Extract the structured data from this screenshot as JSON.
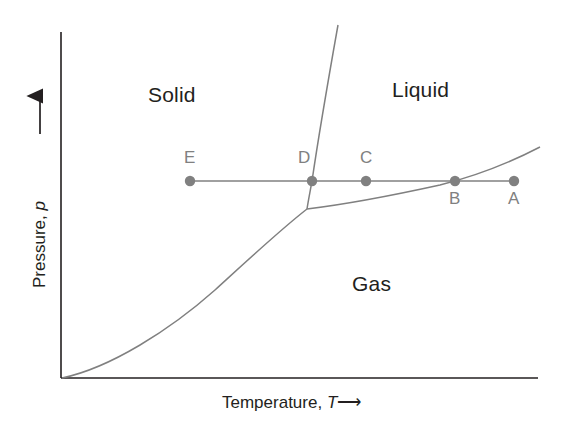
{
  "figure": {
    "kind": "phase-diagram",
    "background_color": "#ffffff",
    "axis_color": "#231f20",
    "curve_color": "#808080",
    "point_color": "#808080",
    "label_color": "#231f20"
  },
  "axes": {
    "y": {
      "title_text": "Pressure, ",
      "title_symbol": "p",
      "title_arrow": "⟶",
      "orientation": "vertical",
      "arrowhead": "up"
    },
    "x": {
      "title_text": "Temperature, ",
      "title_symbol": "T",
      "title_arrow": "⟶",
      "orientation": "horizontal",
      "arrowhead": "none"
    }
  },
  "regions": [
    {
      "id": "solid",
      "label": "Solid",
      "x": 148,
      "y": 83
    },
    {
      "id": "liquid",
      "label": "Liquid",
      "x": 392,
      "y": 78
    },
    {
      "id": "gas",
      "label": "Gas",
      "x": 352,
      "y": 272
    }
  ],
  "points": [
    {
      "id": "A",
      "label": "A",
      "cx": 514,
      "cy": 181,
      "label_x": 508,
      "label_y": 189,
      "on_curve": "none"
    },
    {
      "id": "B",
      "label": "B",
      "cx": 455,
      "cy": 181,
      "label_x": 449,
      "label_y": 189,
      "on_curve": "vaporization"
    },
    {
      "id": "C",
      "label": "C",
      "cx": 366,
      "cy": 181,
      "label_x": 360,
      "label_y": 148,
      "on_curve": "none"
    },
    {
      "id": "D",
      "label": "D",
      "cx": 312,
      "cy": 181,
      "label_x": 298,
      "label_y": 148,
      "on_curve": "fusion"
    },
    {
      "id": "E",
      "label": "E",
      "cx": 190,
      "cy": 181,
      "label_x": 184,
      "label_y": 148,
      "on_curve": "none"
    }
  ],
  "chart_data": {
    "type": "line",
    "title": "",
    "xlabel": "Temperature, T",
    "ylabel": "Pressure, p",
    "grid": false,
    "legend": "none",
    "axis_origin": {
      "x": 61,
      "y": 378
    },
    "axis_extent": {
      "x_max": 538,
      "y_min": 32
    },
    "triple_point": {
      "x": 307,
      "y": 209
    },
    "series": [
      {
        "name": "sublimation-curve",
        "description": "solid-gas boundary from origin to triple point",
        "points": "M 62,378 C 110,368 170,330 215,290 C 250,258 280,230 307,209"
      },
      {
        "name": "fusion-curve",
        "description": "solid-liquid boundary, steep, from triple point upward through D",
        "points": "M 307,209 C 308,202 310,192 312,181 C 318,140 330,70 338,25"
      },
      {
        "name": "vaporization-curve",
        "description": "liquid-gas boundary from triple point through B rising to the right",
        "points": "M 307,209 C 340,205 390,196 440,185 C 480,175 515,160 540,147"
      },
      {
        "name": "isobaric-path",
        "description": "horizontal constant-pressure line through E, D, C, B, A",
        "points": "M 190,181 L 514,181"
      }
    ]
  }
}
